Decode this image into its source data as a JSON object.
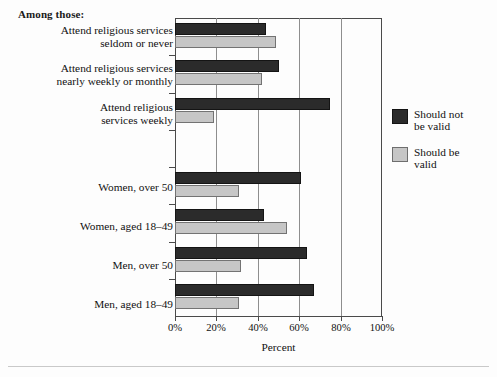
{
  "heading": "Among those:",
  "legend": {
    "position": "right",
    "entries": [
      {
        "label": "Should not\nbe valid",
        "color": "#2b2b2b",
        "swatch": "dark"
      },
      {
        "label": "Should be\nvalid",
        "color": "#c6c6c6",
        "swatch": "light"
      }
    ]
  },
  "axis": {
    "xlabel": "Percent",
    "ticks": [
      "0%",
      "20%",
      "40%",
      "60%",
      "80%",
      "100%"
    ],
    "tick_values": [
      0,
      20,
      40,
      60,
      80,
      100
    ]
  },
  "chart_data": {
    "type": "bar",
    "orientation": "horizontal",
    "title": "",
    "xlabel": "Percent",
    "ylabel": "",
    "xlim": [
      0,
      100
    ],
    "grid": true,
    "legend_position": "right",
    "group_header": "Among those:",
    "categories": [
      "Attend religious services\nseldom or never",
      "Attend religious services\nnearly weekly or monthly",
      "Attend religious\nservices weekly",
      "",
      "Women, over 50",
      "Women, aged 18–49",
      "Men, over 50",
      "Men, aged 18–49"
    ],
    "series": [
      {
        "name": "Should not be valid",
        "color": "#2b2b2b",
        "values": [
          44,
          50,
          75,
          null,
          61,
          43,
          64,
          67
        ]
      },
      {
        "name": "Should be valid",
        "color": "#c6c6c6",
        "values": [
          49,
          42,
          19,
          null,
          31,
          54,
          32,
          31
        ]
      }
    ]
  }
}
